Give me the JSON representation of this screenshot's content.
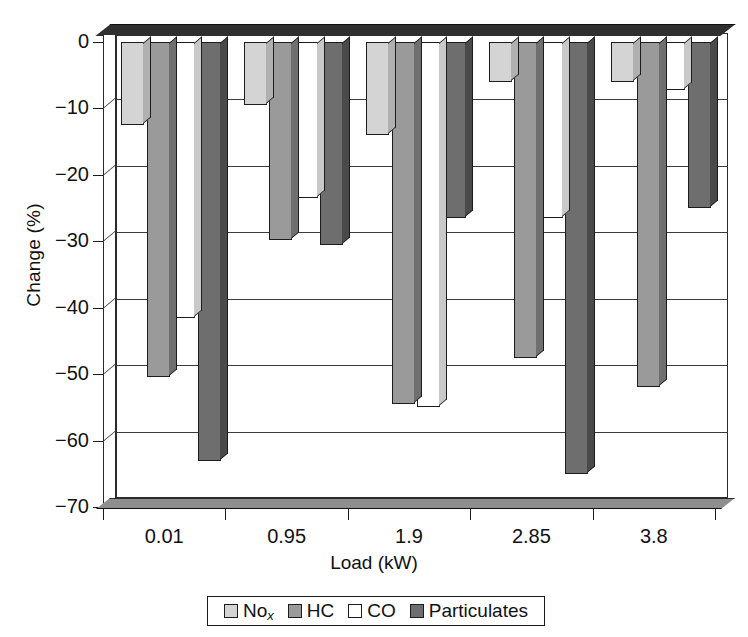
{
  "chart_data": {
    "type": "bar",
    "title": "",
    "subtitle": "",
    "xlabel": "Load (kW)",
    "ylabel": "Change (%)",
    "categories": [
      "0.01",
      "0.95",
      "1.9",
      "2.85",
      "3.8"
    ],
    "series": [
      {
        "name": "No",
        "name_sub": "x",
        "color": "#d4d4d4",
        "side_color": "#b0b0b0",
        "values": [
          -12.5,
          -9.5,
          -14.0,
          -6.0,
          -6.0
        ]
      },
      {
        "name": "HC",
        "name_sub": "",
        "color": "#9a9a9a",
        "side_color": "#6f6f6f",
        "values": [
          -50.5,
          -29.8,
          -54.5,
          -47.5,
          -52.0
        ]
      },
      {
        "name": "CO",
        "name_sub": "",
        "color": "#ffffff",
        "side_color": "#c9c9c9",
        "values": [
          -41.5,
          -23.5,
          -55.0,
          -26.5,
          -7.2
        ]
      },
      {
        "name": "Particulates",
        "name_sub": "",
        "color": "#6e6e6e",
        "side_color": "#4a4a4a",
        "values": [
          -63.0,
          -30.5,
          -26.5,
          -65.0,
          -25.0
        ]
      }
    ],
    "ylim": [
      -70,
      0
    ],
    "yticks": [
      0,
      -10,
      -20,
      -30,
      -40,
      -50,
      -60,
      -70
    ],
    "ytick_labels": [
      "0",
      "−10",
      "−20",
      "−30",
      "−40",
      "−50",
      "−60",
      "−70"
    ],
    "grid": true,
    "legend_position": "bottom-center",
    "style": "3d-bar"
  },
  "legend": {
    "items": [
      {
        "label": "No",
        "sub": "x"
      },
      {
        "label": "HC",
        "sub": ""
      },
      {
        "label": "CO",
        "sub": ""
      },
      {
        "label": "Particulates",
        "sub": ""
      }
    ]
  }
}
